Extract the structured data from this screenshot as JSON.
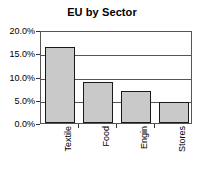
{
  "chart_data": {
    "type": "bar",
    "title": "EU by Sector",
    "xlabel": "",
    "ylabel": "",
    "categories": [
      "Textile",
      "Food",
      "Engin",
      "Stores"
    ],
    "values": [
      16.3,
      8.8,
      6.9,
      4.5
    ],
    "value_labels": [
      "16.3%",
      "8.8%",
      "6.9%",
      "4.5%"
    ],
    "ylim": [
      0,
      20
    ],
    "ytick_values": [
      0,
      5,
      10,
      15,
      20
    ],
    "ytick_labels": [
      "0.0%",
      "5.0%",
      "10.0%",
      "15.0%",
      "20.0%"
    ],
    "grid": "horizontal",
    "legend": "none",
    "series": [
      {
        "name": "EU by Sector",
        "values": [
          16.3,
          8.8,
          6.9,
          4.5
        ]
      }
    ],
    "colors": {
      "bar_fill": "#c9c9c9",
      "bar_border": "#1a1a1a",
      "axis": "#555555",
      "text": "#000000",
      "background": "#ffffff"
    }
  }
}
